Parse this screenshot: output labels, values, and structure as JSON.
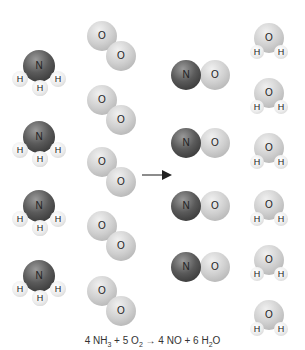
{
  "diagram": {
    "labels": {
      "N": "N",
      "O": "O",
      "H": "H"
    },
    "colors": {
      "nitrogen": "#4a4a4a",
      "oxygen": "#cccccc",
      "hydrogen": "#eeeeee",
      "arrow": "#333333"
    },
    "reactants": {
      "ammonia": {
        "formula": "NH3",
        "count": 4
      },
      "oxygen": {
        "formula": "O2",
        "count": 5
      }
    },
    "products": {
      "nitric_oxide": {
        "formula": "NO",
        "count": 4
      },
      "water": {
        "formula": "H2O",
        "count": 6
      }
    },
    "equation": {
      "nh3_coef": "4 NH",
      "nh3_sub": "3",
      "plus1": " + ",
      "o2_coef": "5 O",
      "o2_sub": "2",
      "arrow": " → ",
      "no_part": "4 NO",
      "plus2": " + ",
      "h2o_coef": "6 H",
      "h2o_sub": "2",
      "h2o_tail": "O"
    }
  }
}
